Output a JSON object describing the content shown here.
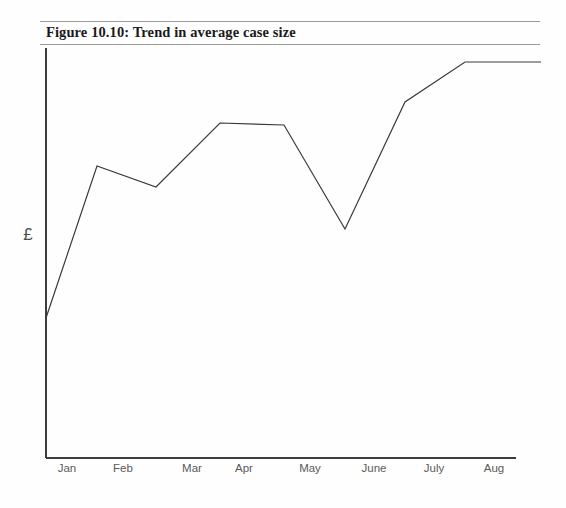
{
  "figure": {
    "caption": "Figure 10.10: Trend in average case size",
    "rule_color": "#9a9a9a",
    "background": "#fefefe"
  },
  "chart_data": {
    "type": "line",
    "title": "Figure 10.10: Trend in average case size",
    "xlabel": "",
    "ylabel": "£",
    "categories": [
      "Jan",
      "Feb",
      "Mar",
      "Apr",
      "May",
      "June",
      "July",
      "Aug"
    ],
    "x_tick_labels": [
      "Jan",
      "Feb",
      "Mar",
      "Apr",
      "May",
      "June",
      "July",
      "Aug"
    ],
    "y_tick_labels": [],
    "grid": false,
    "legend": false,
    "axis_color": "#3c3c3c",
    "line_color": "#3a3a3a",
    "line_width": 1.2,
    "markers": false,
    "note": "Unlabelled y-axis (currency, £). Values below are normalised 0-100 of the plotted axis height, read off the polyline vertices.",
    "ylim": [
      0,
      100
    ],
    "origin_value": 34,
    "series": [
      {
        "name": "Average case size",
        "values": [
          72,
          67,
          82,
          82,
          57,
          90,
          100,
          100
        ]
      }
    ],
    "vertices_px": [
      {
        "label": "start",
        "x": 46,
        "y": 318
      },
      {
        "label": "Jan",
        "x": 97,
        "y": 166
      },
      {
        "label": "Feb",
        "x": 156,
        "y": 187
      },
      {
        "label": "Mar",
        "x": 220,
        "y": 123
      },
      {
        "label": "Apr",
        "x": 284,
        "y": 125
      },
      {
        "label": "May",
        "x": 345,
        "y": 229
      },
      {
        "label": "June",
        "x": 405,
        "y": 102
      },
      {
        "label": "July",
        "x": 465,
        "y": 62
      },
      {
        "label": "Aug",
        "x": 541,
        "y": 62
      }
    ],
    "axes_px": {
      "y_axis_x": 46,
      "y_axis_top": 48,
      "y_axis_bottom": 458,
      "x_axis_y": 458,
      "x_axis_left": 46,
      "x_axis_right": 516
    }
  },
  "xticks": [
    {
      "label": "Jan",
      "cx": 67
    },
    {
      "label": "Feb",
      "cx": 123
    },
    {
      "label": "Mar",
      "cx": 192
    },
    {
      "label": "Apr",
      "cx": 244
    },
    {
      "label": "May",
      "cx": 310
    },
    {
      "label": "June",
      "cx": 374
    },
    {
      "label": "July",
      "cx": 434
    },
    {
      "label": "Aug",
      "cx": 494
    }
  ],
  "yaxis": {
    "label": "£"
  }
}
